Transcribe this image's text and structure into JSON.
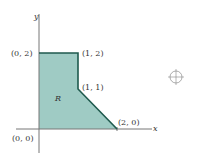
{
  "diagram": {
    "region_label": "R",
    "axes": {
      "x_label": "x",
      "y_label": "y"
    },
    "vertices": [
      {
        "label": "(0, 0)",
        "x": 0,
        "y": 0
      },
      {
        "label": "(0, 2)",
        "x": 0,
        "y": 2
      },
      {
        "label": "(1, 2)",
        "x": 1,
        "y": 2
      },
      {
        "label": "(1, 1)",
        "x": 1,
        "y": 1
      },
      {
        "label": "(2, 0)",
        "x": 2,
        "y": 0
      }
    ],
    "colors": {
      "fill": "#9fcbc4",
      "edge": "#1f5a4e",
      "axis": "#777777",
      "text": "#333333"
    },
    "crosshair_icon": "registration-mark"
  }
}
